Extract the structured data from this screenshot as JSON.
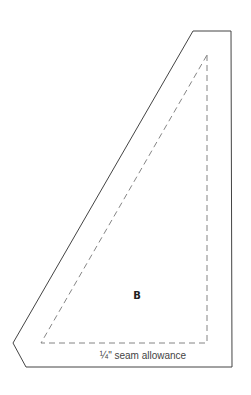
{
  "diagram": {
    "piece_label": "B",
    "seam_label": "¼\" seam allowance",
    "outer_outline": [
      [
        193,
        31
      ],
      [
        231,
        31
      ],
      [
        232,
        367
      ],
      [
        26,
        367
      ],
      [
        13,
        343
      ]
    ],
    "inner_dashed": [
      [
        207,
        55
      ],
      [
        207,
        343
      ],
      [
        41,
        343
      ]
    ],
    "colors": {
      "outline": "#444444",
      "dashed": "#777777",
      "text": "#222222"
    }
  }
}
